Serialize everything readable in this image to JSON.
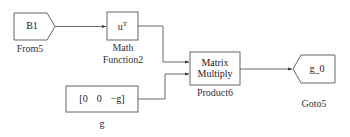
{
  "diagram": {
    "colors": {
      "stroke": "#555555",
      "background": "#ffffff",
      "text": "#222222"
    },
    "blocks": {
      "from": {
        "name": "From5",
        "tag": "B1",
        "type": "From"
      },
      "math": {
        "name_line1": "Math",
        "name_line2": "Function2",
        "expr_base": "u",
        "expr_sup": "T",
        "type": "Math Function"
      },
      "constant": {
        "name": "g",
        "value_parts": [
          "[0",
          "0",
          "−g]"
        ],
        "type": "Constant"
      },
      "product": {
        "name": "Product6",
        "text_line1": "Matrix",
        "text_line2": "Multiply",
        "type": "Product"
      },
      "goto": {
        "name": "Goto5",
        "tag": "g_0",
        "type": "Goto"
      }
    },
    "connections": [
      {
        "from": "From5",
        "to": "Math Function2"
      },
      {
        "from": "Math Function2",
        "to": "Product6 (input 1)"
      },
      {
        "from": "g",
        "to": "Product6 (input 2)"
      },
      {
        "from": "Product6",
        "to": "Goto5"
      }
    ]
  }
}
